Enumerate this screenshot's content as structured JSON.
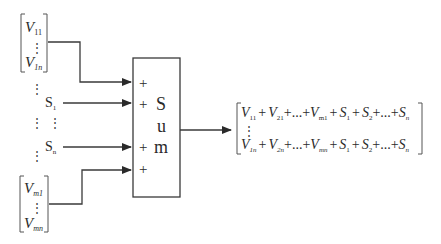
{
  "diagram": {
    "type": "block-diagram",
    "colors": {
      "line": "#3a3a3a",
      "text": "#2a2a2a",
      "background": "#ffffff"
    },
    "inputs": {
      "top_vector": {
        "first": {
          "base": "V",
          "sub": "11"
        },
        "last": {
          "base": "V",
          "sub": "1n"
        },
        "ellipsis": "⋮"
      },
      "scalars": [
        {
          "base": "S",
          "sub": "1"
        },
        {
          "base": "S",
          "sub": "n"
        }
      ],
      "bottom_vector": {
        "first": {
          "base": "V",
          "sub": "m1"
        },
        "last": {
          "base": "V",
          "sub": "mn"
        },
        "ellipsis": "⋮"
      },
      "left_ellipsis": "⋮",
      "right_ellipsis": "⋮"
    },
    "sum_block": {
      "label_letters": [
        "S",
        "u",
        "m"
      ],
      "signs": [
        "+",
        "+",
        "+",
        "+"
      ]
    },
    "output": {
      "row1": [
        {
          "base": "V",
          "sub": "11"
        },
        {
          "op": "+"
        },
        {
          "base": "V",
          "sub": "21"
        },
        {
          "op": "+...+"
        },
        {
          "base": "V",
          "sub": "m1"
        },
        {
          "op": "+"
        },
        {
          "base": "S",
          "sub": "1"
        },
        {
          "op": "+"
        },
        {
          "base": "S",
          "sub": "2"
        },
        {
          "op": "+...+"
        },
        {
          "base": "S",
          "sub": "n"
        }
      ],
      "row2": [
        {
          "base": "V",
          "sub": "1n"
        },
        {
          "op": "+"
        },
        {
          "base": "V",
          "sub": "2n"
        },
        {
          "op": "+...+"
        },
        {
          "base": "V",
          "sub": "mn"
        },
        {
          "op": "+"
        },
        {
          "base": "S",
          "sub": "1"
        },
        {
          "op": "+"
        },
        {
          "base": "S",
          "sub": "2"
        },
        {
          "op": "+...+"
        },
        {
          "base": "S",
          "sub": "n"
        }
      ],
      "ellipsis": "⋮"
    }
  }
}
